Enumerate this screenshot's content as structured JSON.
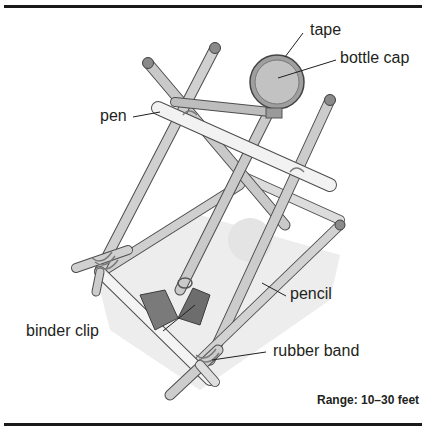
{
  "figure": {
    "labels": {
      "tape": "tape",
      "bottle_cap": "bottle cap",
      "pen": "pen",
      "pencil": "pencil",
      "binder_clip": "binder clip",
      "rubber_band": "rubber band"
    },
    "range_text": "Range: 10–30 feet"
  },
  "colors": {
    "rule": "#1a1a1a",
    "rod_fill": "#c9c9c9",
    "rod_highlight": "#ececec",
    "rod_outline": "#555555",
    "pen_fill": "#f0f0f0",
    "clip_fill": "#7a7a7a",
    "shadow": "#ececec",
    "cap_fill": "#b8b8b8"
  }
}
